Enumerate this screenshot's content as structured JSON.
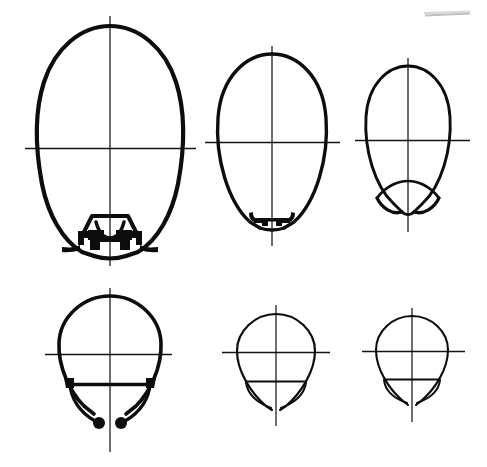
{
  "document": {
    "title": "Technical Drawing — Bulb Cross-Section Profiles",
    "kind": "line-drawing",
    "background_color": "#ffffff",
    "ink_color": "#0d0d0d",
    "axis_color": "#171717",
    "sheet_width": 487,
    "sheet_height": 467,
    "row_count": 2,
    "column_count": 3,
    "figure_count": 6
  },
  "artifacts": {
    "top_right_scan_line": {
      "name": "scan-artifact",
      "x1": 425,
      "y1": 15,
      "x2": 470,
      "y2": 13,
      "color": "#b4b4b4"
    }
  },
  "figures": [
    {
      "id": "figure-1",
      "label": "large-oval-with-clamp-base",
      "row": 1,
      "column": 1,
      "center_x": 110,
      "center_y": 148,
      "half_width": 72,
      "half_height": 122,
      "stroke_width": 4.2,
      "axis": {
        "vertical_top": 16,
        "vertical_bottom": 266,
        "horizontal_left": 25,
        "horizontal_right": 196
      },
      "base_detail": "hexagonal-clamp-with-square-jaws"
    },
    {
      "id": "figure-2",
      "label": "medium-oval-with-twin-hooks",
      "row": 1,
      "column": 2,
      "center_x": 272,
      "center_y": 142,
      "half_width": 55,
      "half_height": 90,
      "stroke_width": 3.4,
      "axis": {
        "vertical_top": 46,
        "vertical_bottom": 246,
        "horizontal_left": 205,
        "horizontal_right": 340
      },
      "base_detail": "twin-inward-hooks-with-flat-bridge"
    },
    {
      "id": "figure-3",
      "label": "small-oval-with-arc-base",
      "row": 1,
      "column": 3,
      "center_x": 408,
      "center_y": 140,
      "half_width": 42,
      "half_height": 72,
      "stroke_width": 2.8,
      "axis": {
        "vertical_top": 58,
        "vertical_bottom": 232,
        "horizontal_left": 355,
        "horizontal_right": 470
      },
      "base_detail": "upward-arc-lens"
    },
    {
      "id": "figure-4",
      "label": "large-teardrop-with-dot-hooks",
      "row": 2,
      "column": 1,
      "center_x": 110,
      "center_y": 354,
      "half_width": 55,
      "half_height": 66,
      "stroke_width": 3.6,
      "axis": {
        "vertical_top": 288,
        "vertical_bottom": 450,
        "horizontal_left": 45,
        "horizontal_right": 172
      },
      "base_detail": "flat-chord-with-two-ball-tipped-hooks"
    },
    {
      "id": "figure-5",
      "label": "medium-teardrop-with-chord",
      "row": 2,
      "column": 2,
      "center_x": 276,
      "center_y": 353,
      "half_width": 39,
      "half_height": 46,
      "stroke_width": 2.2,
      "axis": {
        "vertical_top": 305,
        "vertical_bottom": 425,
        "horizontal_left": 222,
        "horizontal_right": 330
      },
      "base_detail": "flat-chord-with-split-arc-tips"
    },
    {
      "id": "figure-6",
      "label": "small-teardrop-with-chord",
      "row": 2,
      "column": 3,
      "center_x": 412,
      "center_y": 352,
      "half_width": 36,
      "half_height": 43,
      "stroke_width": 2.0,
      "axis": {
        "vertical_top": 308,
        "vertical_bottom": 420,
        "horizontal_left": 362,
        "horizontal_right": 465
      },
      "base_detail": "flat-chord-with-split-arc-tips"
    }
  ]
}
